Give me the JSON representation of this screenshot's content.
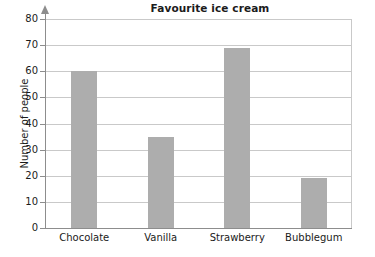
{
  "chart_data": {
    "type": "bar",
    "title": "Favourite ice cream",
    "xlabel": "",
    "ylabel": "Number of people",
    "categories": [
      "Chocolate",
      "Vanilla",
      "Strawberry",
      "Bubblegum"
    ],
    "values": [
      60,
      35,
      69,
      19
    ],
    "ylim": [
      0,
      80
    ],
    "ytick_labels": [
      "0",
      "10",
      "20",
      "30",
      "40",
      "50",
      "60",
      "70",
      "80"
    ],
    "ytick_values": [
      0,
      10,
      20,
      30,
      40,
      50,
      60,
      70,
      80
    ],
    "grid": true,
    "legend": null,
    "bar_color": "#adadad",
    "grid_color": "#c9c9c9",
    "axis_color": "#8d8d8d",
    "background": "#ffffff",
    "series": [
      {
        "name": "Number of people",
        "values": [
          60,
          35,
          69,
          19
        ]
      }
    ]
  }
}
